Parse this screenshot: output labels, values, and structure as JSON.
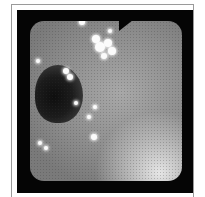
{
  "image": {
    "subject": "endoscopic view of mucosa with lumen opening",
    "frame_color": "#050505",
    "border_color": "#9a9a9a",
    "highlights": [
      {
        "x": 52,
        "y": 1,
        "r": 3
      },
      {
        "x": 66,
        "y": 18,
        "r": 4
      },
      {
        "x": 70,
        "y": 26,
        "r": 5
      },
      {
        "x": 78,
        "y": 22,
        "r": 4
      },
      {
        "x": 82,
        "y": 30,
        "r": 4
      },
      {
        "x": 74,
        "y": 35,
        "r": 3
      },
      {
        "x": 80,
        "y": 10,
        "r": 2
      },
      {
        "x": 36,
        "y": 50,
        "r": 3
      },
      {
        "x": 40,
        "y": 56,
        "r": 3
      },
      {
        "x": 8,
        "y": 40,
        "r": 2
      },
      {
        "x": 46,
        "y": 82,
        "r": 2
      },
      {
        "x": 59,
        "y": 96,
        "r": 2
      },
      {
        "x": 65,
        "y": 86,
        "r": 2
      },
      {
        "x": 64,
        "y": 116,
        "r": 3
      },
      {
        "x": 10,
        "y": 122,
        "r": 2
      },
      {
        "x": 16,
        "y": 127,
        "r": 2
      }
    ]
  }
}
